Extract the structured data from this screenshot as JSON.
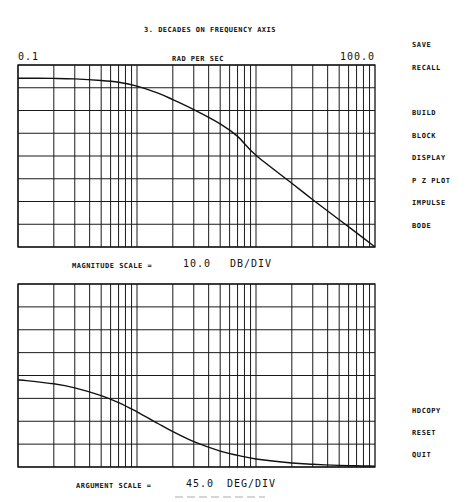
{
  "header": {
    "title": "3. DECADES ON FREQUENCY AXIS",
    "x_min_label": "0.1",
    "x_max_label": "100.0",
    "x_unit_label": "RAD PER SEC"
  },
  "magnitude_panel": {
    "scale_label": "MAGNITUDE SCALE =",
    "scale_value": "10.0",
    "scale_unit": "DB/DIV"
  },
  "phase_panel": {
    "scale_label": "ARGUMENT SCALE =",
    "scale_value": "45.0",
    "scale_unit": "DEG/DIV"
  },
  "menu": {
    "items": [
      {
        "label": "SAVE"
      },
      {
        "label": "RECALL"
      },
      {
        "label": "BUILD"
      },
      {
        "label": "BLOCK"
      },
      {
        "label": "DISPLAY"
      },
      {
        "label": "P Z PLOT"
      },
      {
        "label": "IMPULSE"
      },
      {
        "label": "BODE"
      },
      {
        "label": "HDCOPY"
      },
      {
        "label": "RESET"
      },
      {
        "label": "QUIT"
      }
    ]
  },
  "chart_data": [
    {
      "type": "line",
      "title": "Bode magnitude",
      "xscale": "log",
      "xlim": [
        0.1,
        100.0
      ],
      "xlabel": "RAD PER SEC",
      "ylabel": "dB",
      "ylim": [
        -70,
        10
      ],
      "y_divisions": 8,
      "grid": true,
      "series": [
        {
          "name": "magnitude",
          "x": [
            0.1,
            0.2,
            0.3,
            0.5,
            0.7,
            1.0,
            1.5,
            2.0,
            3.0,
            5.0,
            7.0,
            10.0,
            20.0,
            30.0,
            50.0,
            70.0,
            100.0
          ],
          "y": [
            4.2,
            4.1,
            3.9,
            3.2,
            2.4,
            0.7,
            -2.4,
            -5.2,
            -9.6,
            -15.9,
            -21.4,
            -29.7,
            -42.0,
            -49.2,
            -58.0,
            -63.8,
            -70.0
          ]
        }
      ]
    },
    {
      "type": "line",
      "title": "Bode argument",
      "xscale": "log",
      "xlim": [
        0.1,
        100.0
      ],
      "xlabel": "RAD PER SEC",
      "ylabel": "deg",
      "ylim": [
        -180,
        180
      ],
      "y_divisions": 8,
      "grid": true,
      "series": [
        {
          "name": "phase",
          "x": [
            0.1,
            0.2,
            0.3,
            0.5,
            0.7,
            1.0,
            1.5,
            2.0,
            3.0,
            5.0,
            7.0,
            10.0,
            20.0,
            30.0,
            50.0,
            70.0,
            100.0
          ],
          "y": [
            -8.2,
            -16.4,
            -24.4,
            -39.6,
            -53.4,
            -71.5,
            -94.4,
            -110.4,
            -130.2,
            -148.8,
            -157.2,
            -164.2,
            -172.1,
            -174.7,
            -176.8,
            -177.7,
            -178.4
          ]
        }
      ]
    }
  ]
}
